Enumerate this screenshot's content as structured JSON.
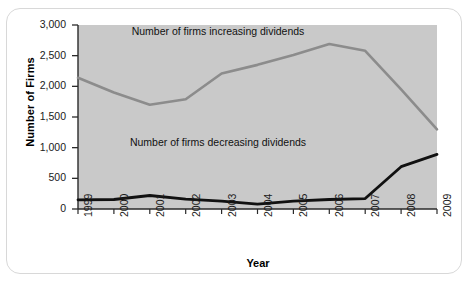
{
  "chart_data": {
    "type": "line",
    "title": "",
    "xlabel": "Year",
    "ylabel": "Number of Firms",
    "categories": [
      "1999",
      "2000",
      "2001",
      "2002",
      "2003",
      "2004",
      "2005",
      "2006",
      "2007",
      "2008",
      "2009"
    ],
    "x": [
      1999,
      2000,
      2001,
      2002,
      2003,
      2004,
      2005,
      2006,
      2007,
      2008,
      2009
    ],
    "ylim": [
      0,
      3000
    ],
    "xlim": [
      1999,
      2009
    ],
    "yticks": [
      0,
      500,
      1000,
      1500,
      2000,
      2500,
      3000
    ],
    "ytick_labels": [
      "0",
      "500",
      "1,000",
      "1,500",
      "2,000",
      "2,500",
      "3,000"
    ],
    "grid": false,
    "legend_position": "inline-annotations",
    "plot_background": "#c9c9c9",
    "series": [
      {
        "name": "Number of firms increasing dividends",
        "color": "#8c8c8c",
        "values": [
          2140,
          1900,
          1700,
          1790,
          2210,
          2350,
          2510,
          2690,
          2580,
          1950,
          1300
        ]
      },
      {
        "name": "Number of firms decreasing dividends",
        "color": "#111111",
        "values": [
          150,
          155,
          220,
          160,
          130,
          80,
          130,
          155,
          170,
          690,
          890
        ]
      }
    ],
    "annotations": [
      {
        "text": "Number of firms increasing dividends",
        "x": 2002.9,
        "y": 2880
      },
      {
        "text": "Number of firms decreasing dividends",
        "x": 2002.9,
        "y": 1080
      }
    ]
  }
}
